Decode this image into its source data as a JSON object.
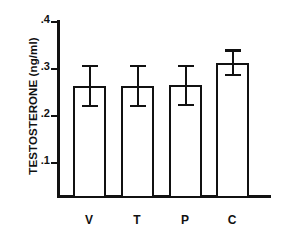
{
  "chart_data": {
    "type": "bar",
    "title": "",
    "xlabel": "",
    "ylabel": "TESTOSTERONE (ng/ml)",
    "categories": [
      "V",
      "T",
      "P",
      "C"
    ],
    "values": [
      0.252,
      0.252,
      0.253,
      0.305
    ],
    "errors_upper": [
      0.048,
      0.048,
      0.047,
      0.03
    ],
    "errors_lower": [
      0.048,
      0.048,
      0.047,
      0.03
    ],
    "error_upper_values": [
      0.3,
      0.3,
      0.3,
      0.335
    ],
    "error_lower_values": [
      0.204,
      0.204,
      0.206,
      0.275
    ],
    "ylim": [
      0.0,
      0.4
    ],
    "yticks": [
      0.1,
      0.2,
      0.3,
      0.4
    ],
    "ytick_labels": [
      ".1",
      ".2",
      ".3",
      ".4"
    ],
    "grid": false,
    "legend": false,
    "legend_position": "none",
    "bar_facecolor": "#ffffff",
    "bar_edgecolor": "#111111",
    "error_color": "#111111",
    "axis_color": "#111111",
    "background": "#ffffff"
  },
  "axes": {
    "y_label": "TESTOSTERONE (ng/ml)",
    "y_ticks": [
      {
        "label": ".4",
        "value": 0.4
      },
      {
        "label": ".3",
        "value": 0.3
      },
      {
        "label": ".2",
        "value": 0.2
      },
      {
        "label": ".1",
        "value": 0.1
      }
    ],
    "x_categories": [
      {
        "label": "V"
      },
      {
        "label": "T"
      },
      {
        "label": "P"
      },
      {
        "label": "C"
      }
    ]
  }
}
